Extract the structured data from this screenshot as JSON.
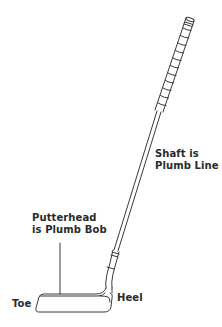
{
  "diagram": {
    "subject": "putter",
    "labels": {
      "shaft": [
        "Shaft is",
        "Plumb Line"
      ],
      "putterhead": [
        "Putterhead",
        "is Plumb Bob"
      ],
      "toe": "Toe",
      "heel": "Heel"
    },
    "colors": {
      "line": "#3a3a3a",
      "text": "#2a2a2a",
      "background": "#ffffff"
    }
  }
}
